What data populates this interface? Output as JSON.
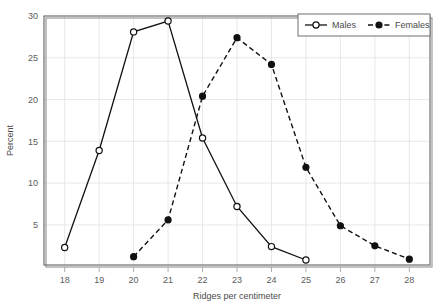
{
  "chart_data": {
    "type": "line",
    "title": "",
    "xlabel": "Ridges per centimeter",
    "ylabel": "Percent",
    "x": [
      18,
      19,
      20,
      21,
      22,
      23,
      24,
      25,
      26,
      27,
      28
    ],
    "xlim": [
      17.4,
      28.6
    ],
    "ylim": [
      0.2,
      30
    ],
    "xticks": [
      "18",
      "19",
      "20",
      "21",
      "22",
      "23",
      "24",
      "25",
      "26",
      "27",
      "28"
    ],
    "yticks": [
      "5",
      "10",
      "15",
      "20",
      "25",
      "30"
    ],
    "ytick_values": [
      5,
      10,
      15,
      20,
      25,
      30
    ],
    "grid": true,
    "legend_position": "top-right",
    "series": [
      {
        "name": "Males",
        "marker": "open-circle",
        "linestyle": "solid",
        "color": "#111111",
        "x": [
          18,
          19,
          20,
          21,
          22,
          23,
          24,
          25
        ],
        "values": [
          2.3,
          13.9,
          28.1,
          29.4,
          15.4,
          7.2,
          2.4,
          0.8
        ]
      },
      {
        "name": "Females",
        "marker": "filled-circle",
        "linestyle": "dashed",
        "color": "#111111",
        "x": [
          20,
          21,
          22,
          23,
          24,
          25,
          26,
          27,
          28
        ],
        "values": [
          1.2,
          5.6,
          20.4,
          27.4,
          24.2,
          11.9,
          4.9,
          2.5,
          0.9
        ]
      }
    ]
  },
  "legend": {
    "items": [
      {
        "label": "Males"
      },
      {
        "label": "Females"
      }
    ]
  },
  "axes": {
    "x_title": "Ridges per centimeter",
    "y_title": "Percent"
  }
}
